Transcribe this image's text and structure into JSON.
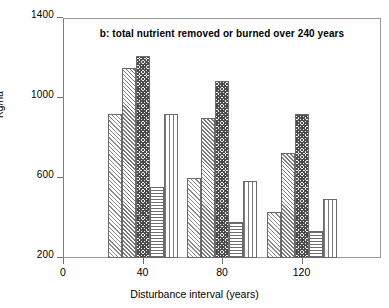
{
  "chart_data": {
    "type": "bar",
    "title": "b: total nutrient removed or burned over 240 years",
    "xlabel": "Disturbance interval (years)",
    "ylabel": "Kg/ha",
    "categories": [
      "40",
      "80",
      "120"
    ],
    "xtick_labels": [
      "0",
      "40",
      "80",
      "120"
    ],
    "xtick_values": [
      0,
      40,
      80,
      120
    ],
    "ytick_labels": [
      "200",
      "600",
      "1000",
      "1400"
    ],
    "ytick_values": [
      200,
      600,
      1000,
      1400
    ],
    "ylim": [
      200,
      1400
    ],
    "xlim": [
      0,
      160
    ],
    "grid": false,
    "legend": "none",
    "series": [
      {
        "name": "series-1",
        "pattern": "diagonal-hatch-light",
        "values": [
          920,
          600,
          430
        ]
      },
      {
        "name": "series-2",
        "pattern": "diagonal-hatch-medium",
        "values": [
          1150,
          900,
          725
        ]
      },
      {
        "name": "series-3",
        "pattern": "checkerboard-dark",
        "values": [
          1210,
          1085,
          920
        ]
      },
      {
        "name": "series-4",
        "pattern": "horizontal-lines",
        "values": [
          555,
          380,
          335
        ]
      },
      {
        "name": "series-5",
        "pattern": "vertical-lines",
        "values": [
          920,
          585,
          495
        ]
      }
    ]
  },
  "axes": {
    "y_title": "Kg/ha",
    "x_title": "Disturbance interval (years)"
  }
}
